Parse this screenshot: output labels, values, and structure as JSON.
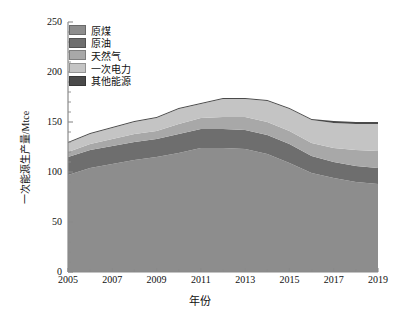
{
  "chart_data": {
    "type": "area",
    "stacked": true,
    "title": "",
    "xlabel": "年份",
    "ylabel": "一次能源生产量/Mtce",
    "x": [
      2005,
      2006,
      2007,
      2008,
      2009,
      2010,
      2011,
      2012,
      2013,
      2014,
      2015,
      2016,
      2017,
      2018,
      2019
    ],
    "xlim": [
      2005,
      2019
    ],
    "ylim": [
      0,
      250
    ],
    "yticks": [
      0,
      50,
      100,
      150,
      200,
      250
    ],
    "xticks": [
      2005,
      2007,
      2009,
      2011,
      2013,
      2015,
      2017,
      2019
    ],
    "grid": false,
    "legend_position": "upper-left",
    "series": [
      {
        "name": "原煤",
        "color": "#8d8d8d",
        "values": [
          97,
          104,
          108,
          112,
          115,
          119,
          124,
          124,
          123,
          118,
          109,
          99,
          94,
          90,
          88
        ]
      },
      {
        "name": "原油",
        "color": "#6e6e6e",
        "values": [
          18,
          18,
          18,
          18,
          18,
          19,
          19,
          19,
          19,
          19,
          19,
          17,
          16,
          16,
          16
        ]
      },
      {
        "name": "天然气",
        "color": "#a8a8a8",
        "values": [
          5,
          6,
          7,
          8,
          8,
          10,
          11,
          12,
          13,
          13,
          13,
          13,
          14,
          16,
          17
        ]
      },
      {
        "name": "一次电力",
        "color": "#c4c4c4",
        "values": [
          9,
          10,
          11,
          12,
          13,
          15,
          14,
          18,
          18,
          21,
          22,
          23,
          25,
          26,
          27
        ]
      },
      {
        "name": "其他能源",
        "color": "#4a4a4a",
        "values": [
          1,
          1,
          1,
          1,
          1,
          1,
          1,
          1,
          1,
          1,
          1,
          1,
          2,
          2,
          2
        ]
      }
    ],
    "totals": [
      130,
      139,
      145,
      151,
      155,
      164,
      169,
      174,
      174,
      172,
      164,
      153,
      151,
      150,
      150
    ],
    "units": "Mtce"
  },
  "axes": {
    "y_tick_labels": [
      "250",
      "200",
      "150",
      "100",
      "50",
      "0"
    ],
    "x_tick_labels": [
      "2005",
      "2007",
      "2009",
      "2011",
      "2013",
      "2015",
      "2017",
      "2019"
    ],
    "y_axis_title": "一次能源生产量/Mtce",
    "x_axis_title": "年份"
  },
  "legend": {
    "items": [
      {
        "label": "原煤",
        "color": "#8d8d8d"
      },
      {
        "label": "原油",
        "color": "#6e6e6e"
      },
      {
        "label": "天然气",
        "color": "#a8a8a8"
      },
      {
        "label": "一次电力",
        "color": "#c4c4c4"
      },
      {
        "label": "其他能源",
        "color": "#4a4a4a"
      }
    ]
  },
  "style": {
    "axis_color": "#8a8a8a",
    "text_color": "#111111",
    "background": "#ffffff"
  }
}
